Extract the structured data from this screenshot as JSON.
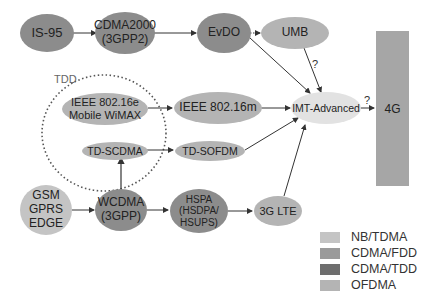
{
  "colors": {
    "nb_tdma": "#c4c4c4",
    "cdma_fdd": "#9a9a9a",
    "cdma_tdd": "#6e6e6e",
    "ofdma": "#b4b4b4",
    "imt": "#e2e2e2",
    "bar4g": "#a6a6a6",
    "arrow": "#333333"
  },
  "nodes": {
    "is95": "IS-95",
    "cdma2000": "CDMA2000\n(3GPP2)",
    "evdo": "EvDO",
    "umb": "UMB",
    "ieee80216e": "IEEE 802.16e\nMobile WiMAX",
    "ieee80216m": "IEEE 802.16m",
    "imt_advanced": "IMT-Advanced",
    "td_scdma": "TD-SCDMA",
    "td_sofdm": "TD-SOFDM",
    "gsm": "GSM\nGPRS\nEDGE",
    "wcdma": "WCDMA\n(3GPP)",
    "hspa": "HSPA\n(HSDPA/\nHSUPS)",
    "lte": "3G LTE",
    "fourg": "4G"
  },
  "labels": {
    "tdd": "TDD",
    "q_umb": "?",
    "q_4g": "?"
  },
  "legend": [
    {
      "label": "NB/TDMA",
      "color": "#c4c4c4"
    },
    {
      "label": "CDMA/FDD",
      "color": "#9a9a9a"
    },
    {
      "label": "CDMA/TDD",
      "color": "#6e6e6e"
    },
    {
      "label": "OFDMA",
      "color": "#b4b4b4"
    }
  ]
}
